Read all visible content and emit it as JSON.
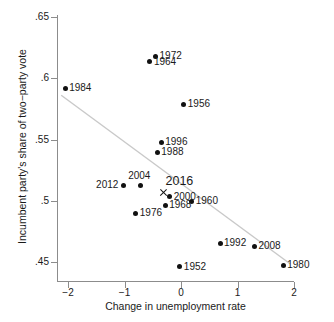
{
  "chart_data": {
    "type": "scatter",
    "title": "",
    "xlabel": "Change in unemployment rate",
    "ylabel": "Incumbent party's share of two−party vote",
    "xlim": [
      -2.3,
      2.2
    ],
    "ylim": [
      0.44,
      0.655
    ],
    "xticks": [
      -2,
      -1,
      0,
      1,
      2
    ],
    "xtick_labels": [
      "−2",
      "−1",
      "0",
      "1",
      "2"
    ],
    "yticks": [
      0.45,
      0.5,
      0.55,
      0.6,
      0.65
    ],
    "ytick_labels": [
      ".45",
      ".5",
      ".55",
      ".6",
      ".65"
    ],
    "grid": false,
    "legend": "none",
    "marker_color": "#111111",
    "fitline_color": "#c9c9c9",
    "axis_color": "#8c8c8c",
    "points": [
      {
        "label": "1984",
        "x": -2.05,
        "y": 0.5918,
        "marker": "dot",
        "label_pos": "right"
      },
      {
        "label": "1972",
        "x": -0.45,
        "y": 0.6182,
        "marker": "dot",
        "label_pos": "right"
      },
      {
        "label": "1964",
        "x": -0.55,
        "y": 0.6135,
        "marker": "dot",
        "label_pos": "right"
      },
      {
        "label": "1956",
        "x": 0.05,
        "y": 0.579,
        "marker": "dot",
        "label_pos": "right"
      },
      {
        "label": "1996",
        "x": -0.35,
        "y": 0.5478,
        "marker": "dot",
        "label_pos": "right"
      },
      {
        "label": "1988",
        "x": -0.42,
        "y": 0.5395,
        "marker": "dot",
        "label_pos": "right"
      },
      {
        "label": "2004",
        "x": -0.72,
        "y": 0.5122,
        "marker": "dot",
        "label_pos": "above"
      },
      {
        "label": "2012",
        "x": -1.02,
        "y": 0.5128,
        "marker": "dot",
        "label_pos": "left"
      },
      {
        "label": "2016",
        "x": -0.31,
        "y": 0.507,
        "marker": "x",
        "label_pos": "above-2016"
      },
      {
        "label": "2000",
        "x": -0.2,
        "y": 0.5032,
        "marker": "dot",
        "label_pos": "right"
      },
      {
        "label": "1960",
        "x": 0.19,
        "y": 0.4995,
        "marker": "dot",
        "label_pos": "right"
      },
      {
        "label": "1968",
        "x": -0.28,
        "y": 0.4965,
        "marker": "dot",
        "label_pos": "right"
      },
      {
        "label": "1976",
        "x": -0.8,
        "y": 0.49,
        "marker": "dot",
        "label_pos": "right"
      },
      {
        "label": "1992",
        "x": 0.69,
        "y": 0.4655,
        "marker": "dot",
        "label_pos": "right"
      },
      {
        "label": "2008",
        "x": 1.3,
        "y": 0.463,
        "marker": "dot",
        "label_pos": "right"
      },
      {
        "label": "1980",
        "x": 1.81,
        "y": 0.4475,
        "marker": "dot",
        "label_pos": "right"
      },
      {
        "label": "1952",
        "x": -0.02,
        "y": 0.446,
        "marker": "dot",
        "label_pos": "right"
      }
    ],
    "fit_line": {
      "x0": -2.12,
      "y0": 0.5862,
      "x1": 1.93,
      "y1": 0.4485
    }
  }
}
